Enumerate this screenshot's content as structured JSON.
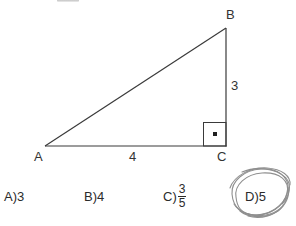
{
  "figure": {
    "type": "right-triangle-diagram",
    "vertices": [
      {
        "name": "B",
        "label": "B",
        "x": 226,
        "y": 28
      },
      {
        "name": "A",
        "label": "A",
        "x": 45,
        "y": 146
      },
      {
        "name": "C",
        "label": "C",
        "x": 226,
        "y": 146
      }
    ],
    "side_labels": {
      "vertical_BC": "3",
      "base_AC": "4"
    },
    "right_angle_marker": {
      "at_vertex": "C",
      "style": "square-with-center-dot"
    },
    "line_color": "#3a3a3a"
  },
  "options": [
    {
      "id": "A",
      "label": "A)3",
      "value": "3"
    },
    {
      "id": "B",
      "label": "B)4",
      "value": "4"
    },
    {
      "id": "C",
      "label": "C)",
      "value": "3/5",
      "numerator": "3",
      "denominator": "5"
    },
    {
      "id": "D",
      "label": "D)5",
      "value": "5",
      "selected": true
    }
  ],
  "annotation": {
    "type": "hand-drawn-circle-scribble",
    "encircles_option": "D",
    "color": "#8c8c8c"
  }
}
